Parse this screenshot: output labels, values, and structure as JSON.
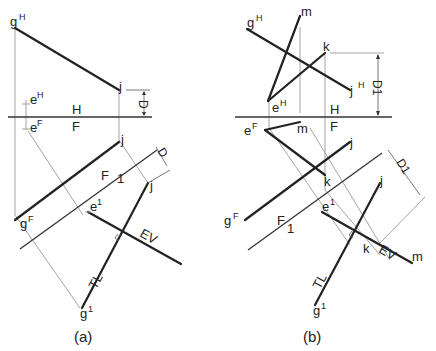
{
  "figure": {
    "panels": [
      {
        "caption": "(a)",
        "labels": {
          "gH": {
            "base": "g",
            "sup": "H"
          },
          "j_top": {
            "base": "j",
            "sup": ""
          },
          "eH": {
            "base": "e",
            "sup": "H"
          },
          "eF": {
            "base": "e",
            "sup": "F"
          },
          "j_front": {
            "base": "j",
            "sup": ""
          },
          "gF": {
            "base": "g",
            "sup": "F"
          },
          "e1": {
            "base": "e",
            "sup": "1"
          },
          "j_aux": {
            "base": "j",
            "sup": ""
          },
          "g1": {
            "base": "g",
            "sup": "1"
          }
        },
        "fold_HF": {
          "upper": "H",
          "lower": "F"
        },
        "fold_F1": {
          "upper": "F",
          "lower": "1"
        },
        "dim_top": "D",
        "dim_aux": "D",
        "annot_ev": "EV",
        "annot_tl": "TL"
      },
      {
        "caption": "(b)",
        "labels": {
          "gH": {
            "base": "g",
            "sup": "H"
          },
          "m_top": {
            "base": "m",
            "sup": ""
          },
          "k_top": {
            "base": "k",
            "sup": ""
          },
          "jH": {
            "base": "j",
            "sup": "H"
          },
          "eH": {
            "base": "e",
            "sup": "H"
          },
          "eF": {
            "base": "e",
            "sup": "F"
          },
          "m_front": {
            "base": "m",
            "sup": ""
          },
          "j_front": {
            "base": "j",
            "sup": ""
          },
          "k_front": {
            "base": "k",
            "sup": ""
          },
          "gF": {
            "base": "g",
            "sup": "F"
          },
          "e1": {
            "base": "e",
            "sup": "1"
          },
          "j_aux": {
            "base": "j",
            "sup": ""
          },
          "k_aux": {
            "base": "k",
            "sup": ""
          },
          "m_aux": {
            "base": "m",
            "sup": ""
          },
          "g1": {
            "base": "g",
            "sup": "1"
          }
        },
        "fold_HF": {
          "upper": "H",
          "lower": "F"
        },
        "fold_F1": {
          "upper": "F",
          "lower": "1"
        },
        "dim_top": "D1",
        "dim_aux": "D1",
        "annot_ev": "EV",
        "annot_tl": "TL"
      }
    ]
  }
}
